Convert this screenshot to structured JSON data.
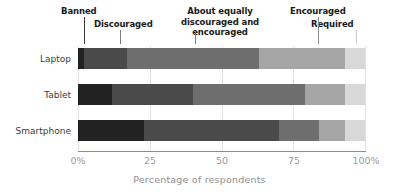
{
  "chart_data": {
    "type": "bar",
    "orientation": "horizontal",
    "stacked": true,
    "normalized_percent": true,
    "title": "",
    "xlabel": "Percentage of respondents",
    "ylabel": "",
    "xlim": [
      0,
      100
    ],
    "xticks": [
      0,
      25,
      50,
      75,
      100
    ],
    "xtick_labels": [
      "0%",
      "25",
      "50",
      "75",
      "100%"
    ],
    "grid": true,
    "grid_axis": "x",
    "legend_position": "above-as-callouts",
    "categories": [
      "Laptop",
      "Tablet",
      "Smartphone"
    ],
    "series": [
      {
        "name": "Banned",
        "color": "#222222",
        "values": [
          2,
          12,
          23
        ]
      },
      {
        "name": "Discouraged",
        "color": "#4a4a4a",
        "values": [
          15,
          28,
          47
        ]
      },
      {
        "name": "About equally discouraged and encouraged",
        "color": "#6e6e6e",
        "values": [
          46,
          39,
          14
        ]
      },
      {
        "name": "Encouraged",
        "color": "#a5a5a5",
        "values": [
          30,
          14,
          9
        ]
      },
      {
        "name": "Required",
        "color": "#d8d8d8",
        "values": [
          7,
          7,
          7
        ]
      }
    ]
  },
  "callouts": {
    "banned": "Banned",
    "discouraged": "Discouraged",
    "about_equally": "About equally discouraged and encouraged",
    "encouraged": "Encouraged",
    "required": "Required"
  },
  "axis": {
    "xlabel": "Percentage of respondents",
    "tick_0": "0%",
    "tick_25": "25",
    "tick_50": "50",
    "tick_75": "75",
    "tick_100": "100%"
  },
  "rows": {
    "laptop": "Laptop",
    "tablet": "Tablet",
    "smartphone": "Smartphone"
  }
}
